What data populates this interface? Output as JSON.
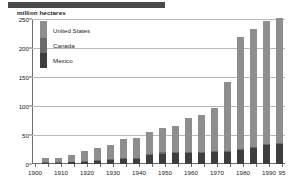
{
  "title_block": {
    "redacted": true,
    "color": "#4a4a4a"
  },
  "axis_caption": "million hectares",
  "legend": {
    "items": [
      {
        "label": "United States",
        "color": "#8e8e8e"
      },
      {
        "label": "Canada",
        "color": "#6a6a6a"
      },
      {
        "label": "Mexico",
        "color": "#3e3e3e"
      }
    ]
  },
  "chart_data": {
    "type": "bar",
    "stacked": true,
    "title": "",
    "xlabel": "",
    "ylabel": "million hectares",
    "ylim": [
      0,
      250
    ],
    "yticks": [
      0,
      50,
      100,
      150,
      200,
      250
    ],
    "grid": true,
    "legend_position": "top-left",
    "categories": [
      "1905",
      "1910",
      "1915",
      "1920",
      "1925",
      "1930",
      "1935",
      "1940",
      "1945",
      "1950",
      "1955",
      "1960",
      "1965",
      "1970",
      "1975",
      "1980",
      "1985",
      "1990",
      "1995"
    ],
    "xtick_labels": [
      "1900",
      "",
      "1910",
      "",
      "1920",
      "",
      "1930",
      "",
      "1940",
      "",
      "1950",
      "",
      "1960",
      "",
      "1970",
      "",
      "1980",
      "",
      "1990",
      "95"
    ],
    "series": [
      {
        "name": "Mexico",
        "color": "#3e3e3e",
        "values": [
          2,
          2,
          3,
          4,
          5,
          7,
          8,
          9,
          16,
          18,
          19,
          19,
          19,
          20,
          21,
          24,
          28,
          32,
          35
        ]
      },
      {
        "name": "Canada",
        "color": "#6a6a6a",
        "values": [
          1,
          1,
          1,
          2,
          2,
          2,
          2,
          2,
          2,
          2,
          2,
          2,
          2,
          2,
          2,
          2,
          2,
          2,
          2
        ]
      },
      {
        "name": "United States",
        "color": "#8e8e8e",
        "values": [
          7,
          8,
          11,
          16,
          20,
          24,
          33,
          34,
          38,
          42,
          44,
          58,
          64,
          74,
          119,
          193,
          202,
          213,
          214
        ]
      }
    ],
    "totals": [
      10,
      11,
      15,
      22,
      27,
      33,
      43,
      45,
      56,
      62,
      65,
      79,
      85,
      96,
      142,
      219,
      232,
      247,
      251
    ]
  }
}
